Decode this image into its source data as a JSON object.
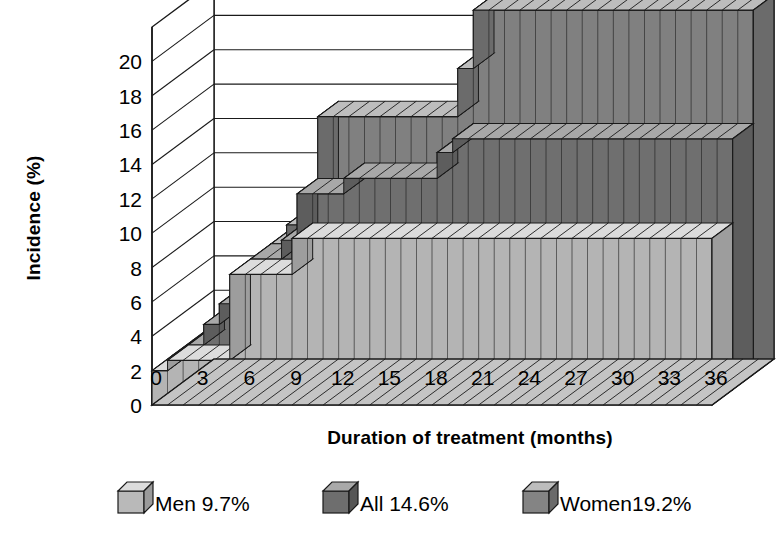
{
  "axes": {
    "y": {
      "title": "Incidence (%)",
      "ticks": [
        "0",
        "2",
        "4",
        "6",
        "8",
        "10",
        "12",
        "14",
        "16",
        "18",
        "20"
      ],
      "min": 0,
      "max": 22
    },
    "x": {
      "title": "Duration of treatment (months)",
      "ticks": [
        "0",
        "3",
        "6",
        "9",
        "12",
        "15",
        "18",
        "21",
        "24",
        "27",
        "30",
        "33",
        "36"
      ],
      "min": 0,
      "max": 36
    }
  },
  "legend": {
    "items": [
      {
        "name": "men",
        "label": "Men 9.7%",
        "swatch_front": "#b9b9b9",
        "swatch_top": "#dcdcdc",
        "swatch_side": "#9a9a9a"
      },
      {
        "name": "all",
        "label": "All 14.6%",
        "swatch_front": "#6e6e6e",
        "swatch_top": "#a9a9a9",
        "swatch_side": "#565656"
      },
      {
        "name": "women",
        "label": "Women19.2%",
        "swatch_front": "#848484",
        "swatch_top": "#bdbdbd",
        "swatch_side": "#6a6a6a"
      }
    ]
  },
  "colors": {
    "men_front": "#b4b4b4",
    "men_top": "#dcdcdc",
    "all_front": "#6f6f6f",
    "all_top": "#a8a8a8",
    "women_front": "#808080",
    "women_top": "#bdbdbd",
    "women_side": "#6b6b6b",
    "floor": "#c4c4c4",
    "outline": "#1a1a1a",
    "background": "#ffffff"
  },
  "chart_data": {
    "type": "area",
    "title": "",
    "subtitle": "",
    "xlabel": "Duration of treatment (months)",
    "ylabel": "Incidence (%)",
    "xlim": [
      0,
      36
    ],
    "ylim": [
      0,
      22
    ],
    "grid": true,
    "legend_position": "bottom",
    "x": [
      0,
      1,
      2,
      3,
      4,
      5,
      6,
      7,
      8,
      9,
      10,
      11,
      12,
      13,
      14,
      15,
      16,
      17,
      18,
      19,
      20,
      21,
      22,
      23,
      24,
      25,
      26,
      27,
      28,
      29,
      30,
      31,
      32,
      33,
      34,
      35,
      36
    ],
    "series": [
      {
        "name": "Men 9.7%",
        "final_value": 9.7,
        "values": [
          0,
          2.0,
          2.6,
          2.6,
          2.6,
          2.6,
          7.6,
          7.6,
          7.6,
          7.6,
          9.7,
          9.7,
          9.7,
          9.7,
          9.7,
          9.7,
          9.7,
          9.7,
          9.7,
          9.7,
          9.7,
          9.7,
          9.7,
          9.7,
          9.7,
          9.7,
          9.7,
          9.7,
          9.7,
          9.7,
          9.7,
          9.7,
          9.7,
          9.7,
          9.7,
          9.7,
          9.7
        ]
      },
      {
        "name": "All 14.6%",
        "final_value": 14.6,
        "values": [
          0,
          2.0,
          2.6,
          3.8,
          5.0,
          5.0,
          7.6,
          7.6,
          8.7,
          11.4,
          11.4,
          11.4,
          12.3,
          12.3,
          12.3,
          12.3,
          12.3,
          12.3,
          13.8,
          14.6,
          14.6,
          14.6,
          14.6,
          14.6,
          14.6,
          14.6,
          14.6,
          14.6,
          14.6,
          14.6,
          14.6,
          14.6,
          14.6,
          14.6,
          14.6,
          14.6,
          14.6
        ]
      },
      {
        "name": "Women19.2%",
        "final_value": 19.2,
        "values": [
          0,
          2.0,
          2.6,
          3.8,
          5.0,
          5.0,
          7.6,
          8.7,
          9.5,
          15.0,
          15.0,
          15.0,
          15.0,
          15.0,
          15.0,
          15.0,
          15.0,
          15.0,
          17.8,
          21.2,
          21.2,
          21.2,
          21.2,
          21.2,
          21.2,
          21.2,
          21.2,
          21.2,
          21.2,
          21.2,
          21.2,
          21.2,
          21.2,
          21.2,
          21.2,
          21.2,
          21.2
        ]
      }
    ]
  }
}
